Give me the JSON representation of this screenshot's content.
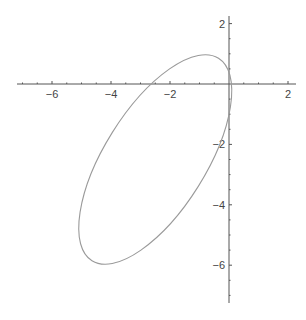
{
  "chart_data": {
    "type": "line",
    "title": "",
    "xlabel": "",
    "ylabel": "",
    "xlim": [
      -7.2,
      2.1
    ],
    "ylim": [
      -7.3,
      2.1
    ],
    "grid": false,
    "x_ticks": [
      -6,
      -4,
      -2,
      2
    ],
    "y_ticks": [
      2,
      -2,
      -4,
      -6
    ],
    "series": [
      {
        "name": "ellipse",
        "shape": "parametric closed curve (tilted ellipse)",
        "center": [
          -2.5,
          -2.5
        ],
        "semi_major": 4.0,
        "semi_minor": 1.7,
        "rotation_deg": 58,
        "color": "#9a9a9a",
        "points": [
          [
            0,
            0
          ],
          [
            -0.75,
            1.05
          ],
          [
            -2.5,
            0
          ],
          [
            -5.05,
            -4.7
          ],
          [
            -4.4,
            -6.0
          ],
          [
            -2.5,
            -2.5
          ],
          [
            0,
            -1.0
          ]
        ]
      }
    ]
  },
  "axes": {
    "x_tick_labels": [
      "-6",
      "-4",
      "-2",
      "2"
    ],
    "y_tick_labels": [
      "2",
      "-2",
      "-4",
      "-6"
    ]
  }
}
